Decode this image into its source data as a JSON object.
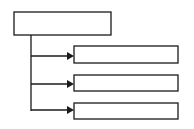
{
  "diagram": {
    "type": "tree",
    "colors": {
      "stroke": "#1a1a1a",
      "fill": "#ffffff"
    },
    "root": {
      "label": "",
      "x": 14,
      "y": 12,
      "w": 97,
      "h": 23
    },
    "children": [
      {
        "label": "",
        "x": 74,
        "y": 46,
        "w": 104,
        "h": 17
      },
      {
        "label": "",
        "x": 74,
        "y": 75,
        "w": 104,
        "h": 16
      },
      {
        "label": "",
        "x": 74,
        "y": 103,
        "w": 104,
        "h": 16
      }
    ],
    "connector": {
      "trunk_x": 31,
      "trunk_top": 35,
      "trunk_bottom": 111
    }
  }
}
